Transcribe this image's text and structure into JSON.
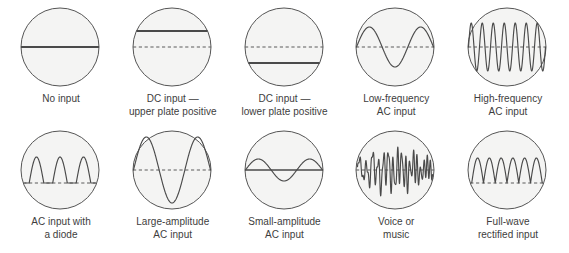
{
  "figure": {
    "background_color": "#ffffff",
    "screen_fill": "#f4f4f3",
    "screen_stroke": "#555555",
    "trace_color": "#4a4a4a",
    "baseline_dash_color": "#5a5a5a",
    "caption_color": "#3d3d3d"
  },
  "rows": [
    {
      "name": "top-row",
      "cells": [
        {
          "id": "no-input",
          "caption": "No input",
          "waveform": "flat-center-solid",
          "baseline": "none",
          "cycles": 0,
          "amplitude": 0
        },
        {
          "id": "dc-upper-plate-positive",
          "caption": "DC input —\nupper plate positive",
          "waveform": "flat-offset-up-solid",
          "baseline": "dashed-center",
          "cycles": 0,
          "amplitude": 0,
          "offset": 16
        },
        {
          "id": "dc-lower-plate-positive",
          "caption": "DC input —\nlower plate positive",
          "waveform": "flat-offset-down-solid",
          "baseline": "dashed-center",
          "cycles": 0,
          "amplitude": 0,
          "offset": -16
        },
        {
          "id": "low-frequency-ac",
          "caption": "Low-frequency\nAC input",
          "waveform": "sine",
          "baseline": "dashed-center",
          "cycles": 1.5,
          "amplitude": 20
        },
        {
          "id": "high-frequency-ac",
          "caption": "High-frequency\nAC input",
          "waveform": "sine",
          "baseline": "dashed-center",
          "cycles": 7,
          "amplitude": 24
        }
      ]
    },
    {
      "name": "bottom-row",
      "cells": [
        {
          "id": "ac-input-with-diode",
          "caption": "AC input with\na diode",
          "waveform": "half-wave-rectified",
          "baseline": "dashed-lower",
          "cycles": 3,
          "amplitude": 26
        },
        {
          "id": "large-amplitude-ac",
          "caption": "Large-amplitude\nAC input",
          "waveform": "sine",
          "baseline": "dashed-center",
          "cycles": 1.5,
          "amplitude": 33
        },
        {
          "id": "small-amplitude-ac",
          "caption": "Small-amplitude\nAC input",
          "waveform": "sine",
          "baseline": "solid-center",
          "cycles": 1.5,
          "amplitude": 11
        },
        {
          "id": "voice-or-music",
          "caption": "Voice or\nmusic",
          "waveform": "complex-audio",
          "baseline": "dashed-center",
          "cycles": 13,
          "amplitude": 26
        },
        {
          "id": "full-wave-rectified",
          "caption": "Full-wave\nrectified input",
          "waveform": "full-wave-rectified",
          "baseline": "dashed-lower",
          "cycles": 6,
          "amplitude": 25
        }
      ]
    }
  ]
}
